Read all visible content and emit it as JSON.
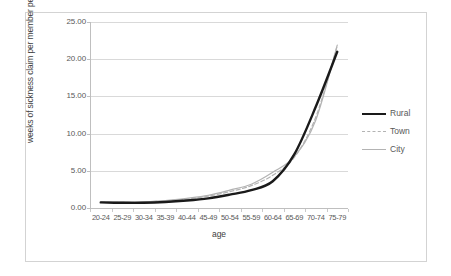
{
  "chart_data": {
    "type": "line",
    "title": "",
    "xlabel": "age",
    "ylabel": "weeks of sickness claim per member per annum",
    "categories": [
      "20-24",
      "25-29",
      "30-34",
      "35-39",
      "40-44",
      "45-49",
      "50-54",
      "55-59",
      "60-64",
      "65-69",
      "70-74",
      "75-79"
    ],
    "ylim": [
      0,
      25
    ],
    "yticks": [
      "0.00",
      "5.00",
      "10.00",
      "15.00",
      "20.00",
      "25.00"
    ],
    "ytick_values": [
      0,
      5,
      10,
      15,
      20,
      25
    ],
    "grid": true,
    "legend_position": "right",
    "series": [
      {
        "name": "Rural",
        "color": "#1a1a1a",
        "style": "solid",
        "width": 2.4,
        "values": [
          0.75,
          0.7,
          0.7,
          0.8,
          1.0,
          1.3,
          1.8,
          2.4,
          3.6,
          7.2,
          13.6,
          21.0
        ]
      },
      {
        "name": "Town",
        "color": "#b3b3b3",
        "style": "dashed",
        "width": 1.2,
        "values": [
          0.75,
          0.75,
          0.8,
          0.95,
          1.2,
          1.6,
          2.2,
          3.0,
          4.4,
          6.8,
          12.2,
          21.8
        ]
      },
      {
        "name": "City",
        "color": "#b3b3b3",
        "style": "solid",
        "width": 1.2,
        "values": [
          0.8,
          0.8,
          0.85,
          1.0,
          1.3,
          1.7,
          2.4,
          3.2,
          4.8,
          6.9,
          11.8,
          21.9
        ]
      }
    ]
  },
  "legend": {
    "items": [
      {
        "label": "Rural"
      },
      {
        "label": "Town"
      },
      {
        "label": "City"
      }
    ]
  }
}
